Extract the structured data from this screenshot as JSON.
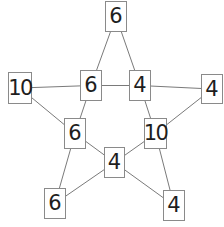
{
  "diagram": {
    "type": "pentagram-number-graph",
    "nodes": [
      {
        "id": "top",
        "value": "6"
      },
      {
        "id": "outer-left",
        "value": "10"
      },
      {
        "id": "inner-left",
        "value": "6"
      },
      {
        "id": "inner-right",
        "value": "4"
      },
      {
        "id": "outer-right",
        "value": "4"
      },
      {
        "id": "inner-lower-left",
        "value": "6"
      },
      {
        "id": "inner-lower-right",
        "value": "10"
      },
      {
        "id": "inner-bottom",
        "value": "4"
      },
      {
        "id": "outer-bottom-left",
        "value": "6"
      },
      {
        "id": "outer-bottom-right",
        "value": "4"
      }
    ],
    "edges": [
      [
        "top",
        "inner-left"
      ],
      [
        "top",
        "inner-right"
      ],
      [
        "outer-left",
        "inner-left"
      ],
      [
        "inner-left",
        "inner-right"
      ],
      [
        "inner-right",
        "outer-right"
      ],
      [
        "outer-left",
        "inner-lower-left"
      ],
      [
        "inner-left",
        "inner-lower-left"
      ],
      [
        "inner-right",
        "inner-lower-right"
      ],
      [
        "outer-right",
        "inner-lower-right"
      ],
      [
        "inner-lower-left",
        "inner-bottom"
      ],
      [
        "inner-lower-right",
        "inner-bottom"
      ],
      [
        "inner-lower-left",
        "outer-bottom-left"
      ],
      [
        "inner-bottom",
        "outer-bottom-left"
      ],
      [
        "inner-bottom",
        "outer-bottom-right"
      ],
      [
        "inner-lower-right",
        "outer-bottom-right"
      ]
    ]
  }
}
